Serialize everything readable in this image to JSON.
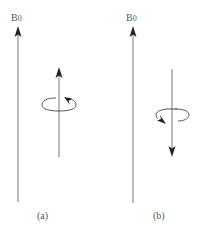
{
  "diagram": {
    "panels": [
      {
        "id": "a",
        "caption": "(a)",
        "field_label": "B0",
        "field_label_main": "B",
        "field_label_sub": "0",
        "spin_direction": "up",
        "rotation_arrow_side": "right"
      },
      {
        "id": "b",
        "caption": "(b)",
        "field_label": "B0",
        "field_label_main": "B",
        "field_label_sub": "0",
        "spin_direction": "down",
        "rotation_arrow_side": "left"
      }
    ],
    "colors": {
      "line": "#777777",
      "arrowhead": "#222222",
      "text": "#555555",
      "background": "#ffffff"
    }
  }
}
